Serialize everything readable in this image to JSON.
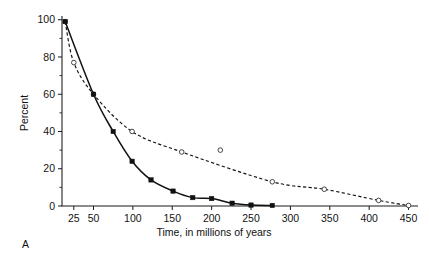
{
  "figure": {
    "panel_label": "A"
  },
  "chart_data": {
    "type": "line",
    "title": "",
    "xlabel": "Time, in millions of years",
    "ylabel": "Percent",
    "xlim": [
      10,
      462
    ],
    "ylim": [
      0,
      102
    ],
    "grid": false,
    "legend": "none",
    "x_ticks": [
      25,
      50,
      100,
      150,
      200,
      250,
      300,
      350,
      400,
      450
    ],
    "x_tick_labels": [
      "25",
      "50",
      "100",
      "150",
      "200",
      "250",
      "300",
      "350",
      "400",
      "450"
    ],
    "y_ticks": [
      0,
      20,
      40,
      60,
      80,
      100
    ],
    "y_tick_labels": [
      "0",
      "20",
      "40",
      "60",
      "80",
      "100"
    ],
    "y_minor_ticks": [
      10,
      30,
      50,
      70,
      90
    ],
    "series": [
      {
        "name": "solid-curve",
        "style": "solid",
        "marker": "filled-square",
        "points": [
          {
            "x": 14,
            "y": 99
          },
          {
            "x": 50,
            "y": 60
          },
          {
            "x": 75,
            "y": 40
          },
          {
            "x": 99,
            "y": 24
          },
          {
            "x": 123,
            "y": 14
          },
          {
            "x": 151,
            "y": 8
          },
          {
            "x": 176,
            "y": 4.5
          },
          {
            "x": 200,
            "y": 4
          },
          {
            "x": 226,
            "y": 1.5
          },
          {
            "x": 250,
            "y": 0.5
          },
          {
            "x": 277,
            "y": 0.3
          }
        ]
      },
      {
        "name": "dashed-curve",
        "style": "dashed",
        "marker": "open-circle",
        "points": [
          {
            "x": 14,
            "y": 99
          },
          {
            "x": 25,
            "y": 77
          },
          {
            "x": 50,
            "y": 60
          },
          {
            "x": 99,
            "y": 40
          },
          {
            "x": 162,
            "y": 29
          },
          {
            "x": 211,
            "y": 30
          },
          {
            "x": 277,
            "y": 13
          },
          {
            "x": 343,
            "y": 9
          },
          {
            "x": 412,
            "y": 3
          },
          {
            "x": 450,
            "y": 0.3
          }
        ]
      }
    ]
  }
}
